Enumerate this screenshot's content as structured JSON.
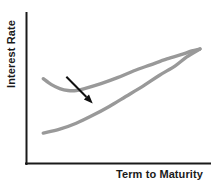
{
  "chart_data": {
    "type": "line",
    "title": "",
    "subtitle": "",
    "xlabel": "Term to Maturity",
    "ylabel": "Interest Rate",
    "xlim": [
      0,
      100
    ],
    "ylim": [
      0,
      100
    ],
    "grid": false,
    "legend": "none",
    "axis_ticks": "none",
    "axis_color": "#1a1a1a",
    "curve_color": "#999999",
    "annotation_color": "#111111",
    "series": [
      {
        "name": "Humped yield curve",
        "color": "#999999",
        "points": [
          [
            5,
            68
          ],
          [
            10,
            62
          ],
          [
            15,
            58
          ],
          [
            20,
            56
          ],
          [
            25,
            56
          ],
          [
            30,
            58
          ],
          [
            40,
            63
          ],
          [
            50,
            69
          ],
          [
            60,
            76
          ],
          [
            70,
            82
          ],
          [
            80,
            88
          ],
          [
            90,
            93
          ],
          [
            95,
            96
          ],
          [
            100,
            98
          ]
        ]
      },
      {
        "name": "Normal upward-sloping yield curve",
        "color": "#999999",
        "points": [
          [
            5,
            13
          ],
          [
            15,
            17
          ],
          [
            25,
            23
          ],
          [
            35,
            31
          ],
          [
            45,
            40
          ],
          [
            55,
            50
          ],
          [
            65,
            60
          ],
          [
            75,
            71
          ],
          [
            85,
            81
          ],
          [
            92,
            90
          ],
          [
            100,
            98
          ]
        ]
      }
    ],
    "annotations": [
      {
        "type": "arrow",
        "label": "downward-shift-arrow",
        "from": [
          19,
          70
        ],
        "to": [
          35,
          43
        ],
        "color": "#111111"
      }
    ]
  },
  "labels": {
    "y_axis": "Interest Rate",
    "x_axis": "Term to Maturity"
  }
}
